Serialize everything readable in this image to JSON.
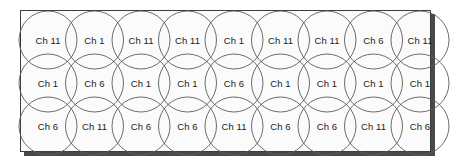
{
  "diagram": {
    "type": "cell-coverage-grid",
    "colors": {
      "area_fill": "#fbfbfb",
      "area_border": "#3d3d3d",
      "shadow": "#4a4a4a",
      "circle_stroke": "#5b5b5b",
      "label_text": "#1a1a1a"
    },
    "geometry": {
      "columns": 9,
      "rows": 3,
      "circle_radius": 29,
      "column_spacing": 46.5,
      "row_spacing": 43,
      "first_center_x": 48,
      "first_center_y": 40,
      "area_left": 20,
      "area_top": 10,
      "area_width": 411,
      "area_height": 142
    },
    "rows": [
      {
        "index": 1,
        "cells": [
          {
            "label": "Ch 11",
            "channel": 11
          },
          {
            "label": "Ch 1",
            "channel": 1
          },
          {
            "label": "Ch 11",
            "channel": 11
          },
          {
            "label": "Ch 11",
            "channel": 11
          },
          {
            "label": "Ch 1",
            "channel": 1
          },
          {
            "label": "Ch 11",
            "channel": 11
          },
          {
            "label": "Ch 11",
            "channel": 11
          },
          {
            "label": "Ch 6",
            "channel": 6
          },
          {
            "label": "Ch 11",
            "channel": 11
          }
        ]
      },
      {
        "index": 2,
        "cells": [
          {
            "label": "Ch 1",
            "channel": 1
          },
          {
            "label": "Ch 6",
            "channel": 6
          },
          {
            "label": "Ch 1",
            "channel": 1
          },
          {
            "label": "Ch 1",
            "channel": 1
          },
          {
            "label": "Ch 6",
            "channel": 6
          },
          {
            "label": "Ch 1",
            "channel": 1
          },
          {
            "label": "Ch 1",
            "channel": 1
          },
          {
            "label": "Ch 1",
            "channel": 1
          },
          {
            "label": "Ch 1",
            "channel": 1
          }
        ]
      },
      {
        "index": 3,
        "cells": [
          {
            "label": "Ch 6",
            "channel": 6
          },
          {
            "label": "Ch 11",
            "channel": 11
          },
          {
            "label": "Ch 6",
            "channel": 6
          },
          {
            "label": "Ch 6",
            "channel": 6
          },
          {
            "label": "Ch 11",
            "channel": 11
          },
          {
            "label": "Ch 6",
            "channel": 6
          },
          {
            "label": "Ch 6",
            "channel": 6
          },
          {
            "label": "Ch 11",
            "channel": 11
          },
          {
            "label": "Ch 6",
            "channel": 6
          }
        ]
      }
    ]
  }
}
